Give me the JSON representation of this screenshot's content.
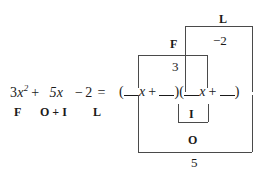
{
  "diagram": {
    "equation": {
      "left_coefficient": "3",
      "left_variable": "x",
      "left_exponent": "2",
      "plus_sign": "+",
      "middle_term": "5x",
      "minus_sign": "−",
      "constant": "2",
      "equals": "=",
      "full_left_side": "3x2 + 5x − 2 ="
    },
    "factored_form": {
      "open_paren_1": "(",
      "x_1": "x",
      "plus_1": "+",
      "close_paren_1": ")",
      "open_paren_2": "(",
      "x_2": "x",
      "plus_2": "+",
      "close_paren_2": ")",
      "blank_label": "__"
    },
    "term_labels": {
      "first": "F",
      "outer_inner": "O + I",
      "last": "L"
    },
    "brackets": [
      {
        "id": "last",
        "label": "L",
        "value": "−2",
        "position": "top-outer"
      },
      {
        "id": "first",
        "label": "F",
        "value": "3",
        "position": "top-inner"
      },
      {
        "id": "inner",
        "label": "I",
        "value": "",
        "position": "bottom-inner"
      },
      {
        "id": "outer",
        "label": "O",
        "value": "5",
        "position": "bottom-outer"
      }
    ],
    "colors": {
      "ink": "#1a1a1a",
      "rule": "#4a4a4a",
      "background": "#ffffff"
    }
  }
}
